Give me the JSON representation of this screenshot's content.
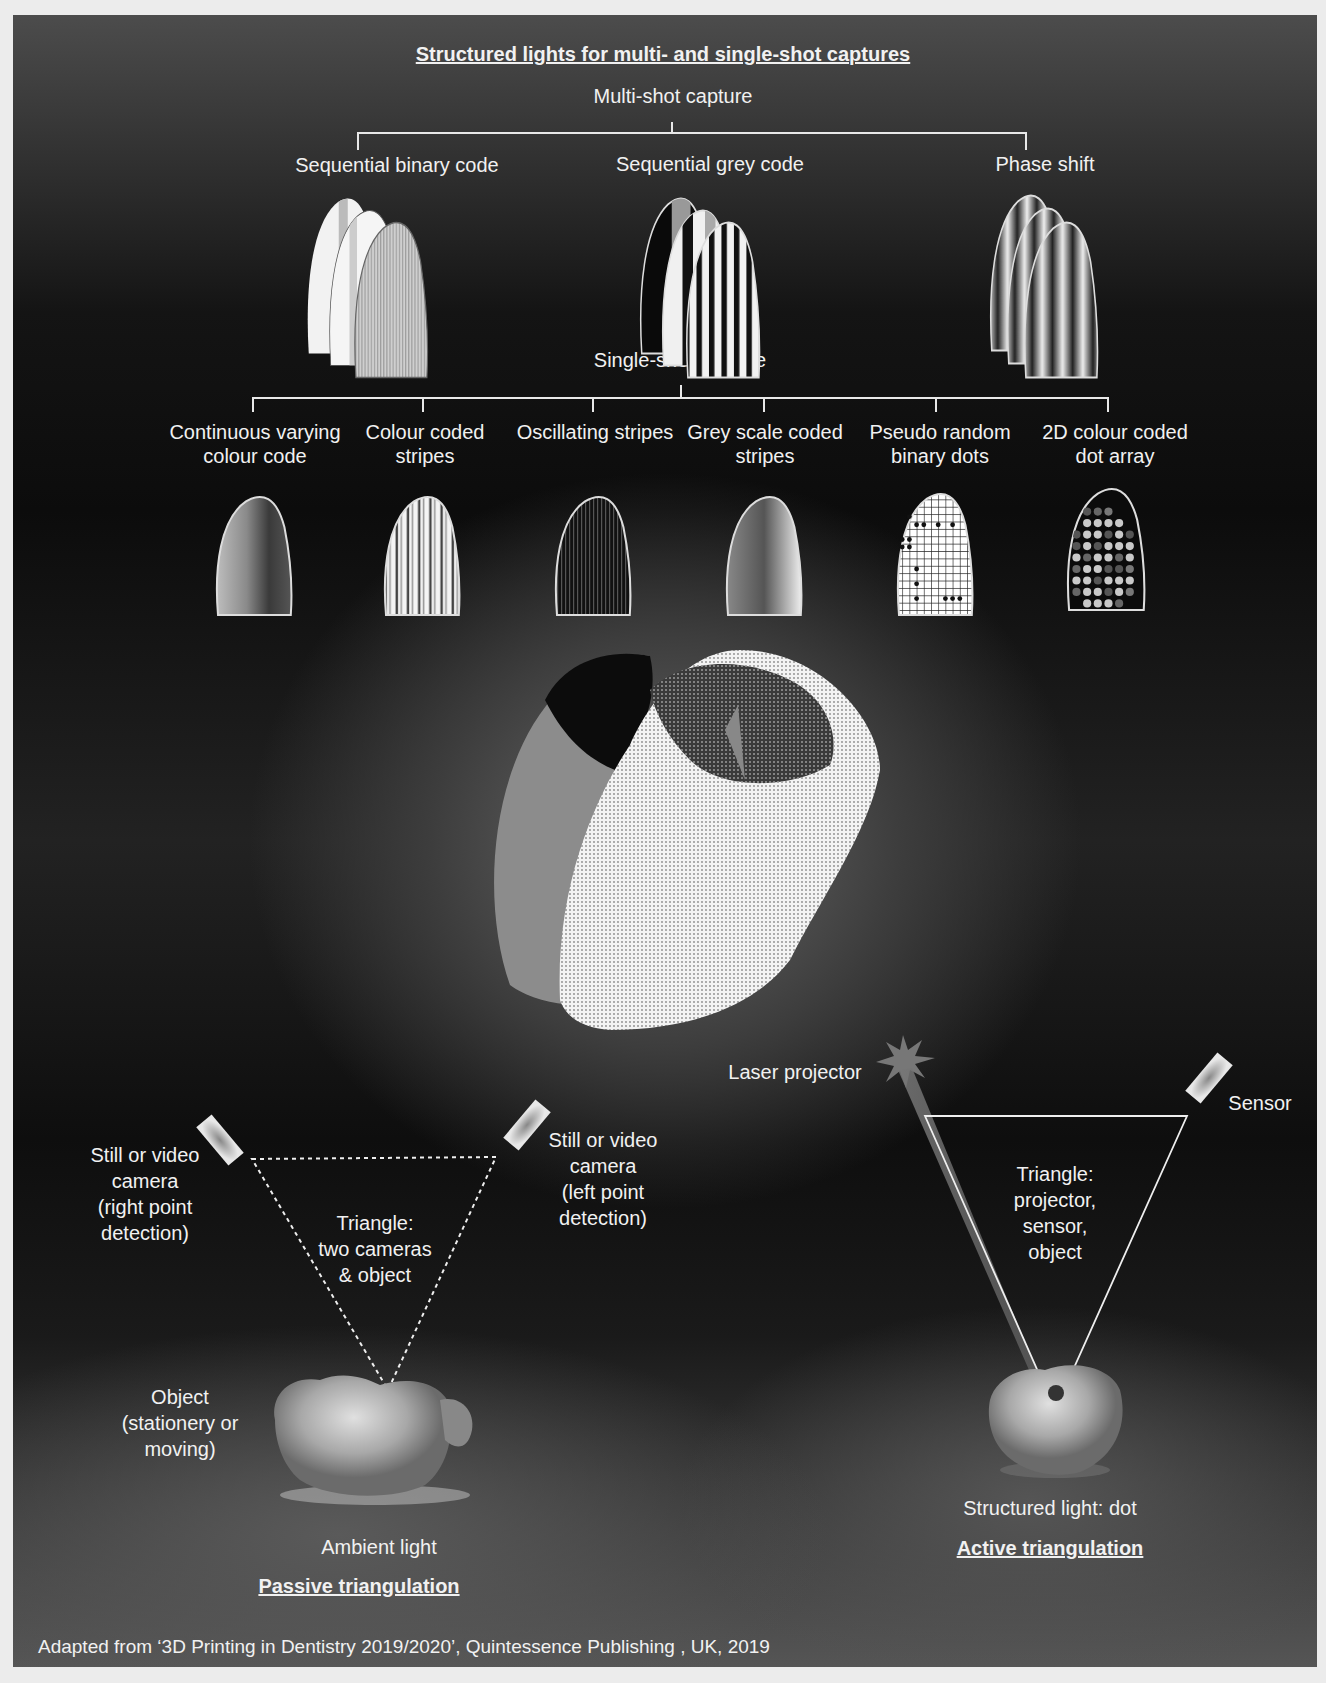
{
  "title": "Structured lights for multi- and single-shot captures",
  "multi_shot": {
    "heading": "Multi-shot capture",
    "methods": [
      {
        "label": "Sequential binary code",
        "pattern": "binary-stripes"
      },
      {
        "label": "Sequential grey code",
        "pattern": "grey-code-stripes"
      },
      {
        "label": "Phase shift",
        "pattern": "sinusoidal-fringes"
      }
    ]
  },
  "single_shot": {
    "heading": "Single-shot capture",
    "methods": [
      {
        "line1": "Continuous varying",
        "line2": "colour code",
        "pattern": "continuous-gradient"
      },
      {
        "line1": "Colour coded",
        "line2": "stripes",
        "pattern": "colour-stripes"
      },
      {
        "line1": "Oscillating stripes",
        "line2": "",
        "pattern": "fine-oscillating-stripes"
      },
      {
        "line1": "Grey scale coded",
        "line2": "stripes",
        "pattern": "grey-scale-stripes"
      },
      {
        "line1": "Pseudo random",
        "line2": "binary dots",
        "pattern": "grid-with-dots"
      },
      {
        "line1": "2D colour coded",
        "line2": "dot array",
        "pattern": "dot-array"
      }
    ]
  },
  "center_model": {
    "description": "3D point-cloud scan of an incisor crown"
  },
  "passive": {
    "camera_right": [
      "Still or video",
      "camera",
      "(right point",
      "detection)"
    ],
    "camera_left": [
      "Still or video",
      "camera",
      "(left point",
      "detection)"
    ],
    "triangle": [
      "Triangle:",
      "two cameras",
      "& object"
    ],
    "object": [
      "Object",
      "(stationery or",
      "moving)"
    ],
    "light": "Ambient light",
    "heading": "Passive triangulation"
  },
  "active": {
    "projector": "Laser projector",
    "sensor": "Sensor",
    "triangle": [
      "Triangle:",
      "projector,",
      "sensor,",
      "object"
    ],
    "light": "Structured light: dot",
    "heading": "Active triangulation"
  },
  "footer": "Adapted from ‘3D Printing in Dentistry 2019/2020’, Quintessence Publishing , UK, 2019",
  "colors": {
    "background_outer": "#ececec",
    "panel_dark": "#0c0c0c",
    "text": "#f1f1f1",
    "lines": "#e8e8e8"
  }
}
